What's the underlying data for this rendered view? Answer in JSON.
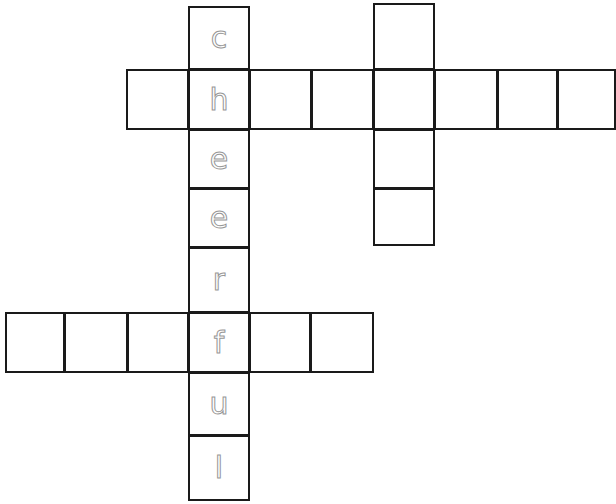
{
  "puzzle": {
    "type": "crossword",
    "traced_word": "cheerful",
    "letter_color": "#8c8c8c",
    "border_color": "#1a1a1a",
    "cells": [
      {
        "id": "v1-1",
        "x": 188,
        "y": 6,
        "w": 62,
        "h": 64,
        "letter": "c"
      },
      {
        "id": "v1-2",
        "x": 188,
        "y": 69,
        "w": 62,
        "h": 61,
        "letter": "h"
      },
      {
        "id": "v1-3",
        "x": 188,
        "y": 129,
        "w": 62,
        "h": 60,
        "letter": "e"
      },
      {
        "id": "v1-4",
        "x": 188,
        "y": 188,
        "w": 62,
        "h": 60,
        "letter": "e"
      },
      {
        "id": "v1-5",
        "x": 188,
        "y": 247,
        "w": 62,
        "h": 66,
        "letter": "r"
      },
      {
        "id": "v1-6",
        "x": 188,
        "y": 312,
        "w": 62,
        "h": 61,
        "letter": "f"
      },
      {
        "id": "v1-7",
        "x": 188,
        "y": 372,
        "w": 62,
        "h": 64,
        "letter": "u"
      },
      {
        "id": "v1-8",
        "x": 188,
        "y": 435,
        "w": 62,
        "h": 66,
        "letter": "l"
      },
      {
        "id": "h1-1",
        "x": 126,
        "y": 69,
        "w": 63,
        "h": 61,
        "letter": ""
      },
      {
        "id": "h1-3",
        "x": 249,
        "y": 69,
        "w": 63,
        "h": 61,
        "letter": ""
      },
      {
        "id": "h1-4",
        "x": 311,
        "y": 69,
        "w": 63,
        "h": 61,
        "letter": ""
      },
      {
        "id": "h1-5",
        "x": 373,
        "y": 69,
        "w": 62,
        "h": 61,
        "letter": ""
      },
      {
        "id": "h1-6",
        "x": 434,
        "y": 69,
        "w": 64,
        "h": 61,
        "letter": ""
      },
      {
        "id": "h1-7",
        "x": 497,
        "y": 69,
        "w": 61,
        "h": 61,
        "letter": ""
      },
      {
        "id": "h1-8",
        "x": 557,
        "y": 69,
        "w": 59,
        "h": 61,
        "letter": ""
      },
      {
        "id": "v2-1",
        "x": 373,
        "y": 3,
        "w": 62,
        "h": 67,
        "letter": ""
      },
      {
        "id": "v2-3",
        "x": 373,
        "y": 129,
        "w": 62,
        "h": 60,
        "letter": ""
      },
      {
        "id": "v2-4",
        "x": 373,
        "y": 188,
        "w": 62,
        "h": 58,
        "letter": ""
      },
      {
        "id": "h2-1",
        "x": 5,
        "y": 312,
        "w": 60,
        "h": 61,
        "letter": ""
      },
      {
        "id": "h2-2",
        "x": 64,
        "y": 312,
        "w": 64,
        "h": 61,
        "letter": ""
      },
      {
        "id": "h2-3",
        "x": 127,
        "y": 312,
        "w": 62,
        "h": 61,
        "letter": ""
      },
      {
        "id": "h2-5",
        "x": 249,
        "y": 312,
        "w": 62,
        "h": 61,
        "letter": ""
      },
      {
        "id": "h2-6",
        "x": 310,
        "y": 312,
        "w": 64,
        "h": 61,
        "letter": ""
      }
    ]
  }
}
